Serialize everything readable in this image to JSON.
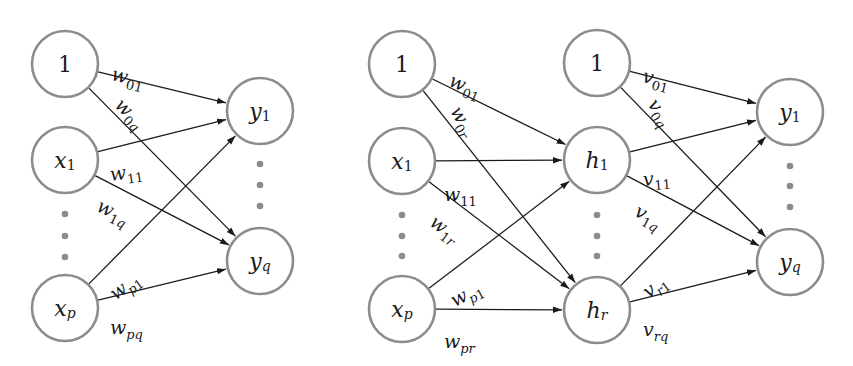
{
  "diagrams": [
    {
      "name": "single-layer-network",
      "node_radius": 33,
      "nodes": [
        {
          "id": "bias",
          "base": "1",
          "sub": "",
          "x": 65,
          "y": 64
        },
        {
          "id": "x1",
          "base": "x",
          "sub": "1",
          "x": 65,
          "y": 160
        },
        {
          "id": "xp",
          "base": "x",
          "sub": "p",
          "x": 65,
          "y": 308
        },
        {
          "id": "y1",
          "base": "y",
          "sub": "1",
          "x": 260,
          "y": 111
        },
        {
          "id": "yq",
          "base": "y",
          "sub": "q",
          "x": 260,
          "y": 261
        }
      ],
      "ellipses": [
        {
          "x": 65,
          "ys": [
            214,
            236,
            257
          ]
        },
        {
          "x": 260,
          "ys": [
            164,
            185,
            206
          ]
        }
      ],
      "edges": [
        {
          "from": "bias",
          "to": "y1",
          "label": "w",
          "sub": "01",
          "lx": 112,
          "ly": 64,
          "rot": 14
        },
        {
          "from": "bias",
          "to": "yq",
          "label": "w",
          "sub": "0q",
          "lx": 118,
          "ly": 92,
          "rot": 44
        },
        {
          "from": "x1",
          "to": "y1",
          "label": "w",
          "sub": "11",
          "lx": 110,
          "ly": 165,
          "rot": -8
        },
        {
          "from": "x1",
          "to": "yq",
          "label": "w",
          "sub": "1q",
          "lx": 98,
          "ly": 195,
          "rot": 25
        },
        {
          "from": "xp",
          "to": "y1",
          "label": "w",
          "sub": "p1",
          "lx": 112,
          "ly": 286,
          "rot": -36
        },
        {
          "from": "xp",
          "to": "yq",
          "label": "w",
          "sub": "pq",
          "lx": 110,
          "ly": 318,
          "rot": 0
        }
      ]
    },
    {
      "name": "two-layer-network",
      "node_radius": 33,
      "nodes": [
        {
          "id": "bias_in",
          "base": "1",
          "sub": "",
          "x": 402,
          "y": 64
        },
        {
          "id": "x1",
          "base": "x",
          "sub": "1",
          "x": 402,
          "y": 161
        },
        {
          "id": "xp",
          "base": "x",
          "sub": "p",
          "x": 402,
          "y": 309
        },
        {
          "id": "bias_h",
          "base": "1",
          "sub": "",
          "x": 597,
          "y": 63
        },
        {
          "id": "h1",
          "base": "h",
          "sub": "1",
          "x": 597,
          "y": 160
        },
        {
          "id": "hr",
          "base": "h",
          "sub": "r",
          "x": 597,
          "y": 310
        },
        {
          "id": "y1",
          "base": "y",
          "sub": "1",
          "x": 790,
          "y": 112
        },
        {
          "id": "yq",
          "base": "y",
          "sub": "q",
          "x": 790,
          "y": 262
        }
      ],
      "ellipses": [
        {
          "x": 402,
          "ys": [
            215,
            236,
            256
          ]
        },
        {
          "x": 597,
          "ys": [
            215,
            236,
            256
          ]
        },
        {
          "x": 790,
          "ys": [
            166,
            186,
            207
          ]
        }
      ],
      "edges": [
        {
          "from": "bias_in",
          "to": "h1",
          "label": "w",
          "sub": "01",
          "lx": 450,
          "ly": 70,
          "rot": 22
        },
        {
          "from": "bias_in",
          "to": "hr",
          "label": "w",
          "sub": "0r",
          "lx": 455,
          "ly": 98,
          "rot": 60
        },
        {
          "from": "x1",
          "to": "h1",
          "label": "w",
          "sub": "11",
          "lx": 444,
          "ly": 185,
          "rot": 0
        },
        {
          "from": "x1",
          "to": "hr",
          "label": "w",
          "sub": "1r",
          "lx": 432,
          "ly": 210,
          "rot": 36
        },
        {
          "from": "xp",
          "to": "h1",
          "label": "w",
          "sub": "p1",
          "lx": 452,
          "ly": 292,
          "rot": -28
        },
        {
          "from": "xp",
          "to": "hr",
          "label": "w",
          "sub": "pr",
          "lx": 444,
          "ly": 332,
          "rot": 0
        },
        {
          "from": "bias_h",
          "to": "y1",
          "label": "v",
          "sub": "01",
          "lx": 643,
          "ly": 66,
          "rot": 14
        },
        {
          "from": "bias_h",
          "to": "yq",
          "label": "v",
          "sub": "0q",
          "lx": 652,
          "ly": 91,
          "rot": 55
        },
        {
          "from": "h1",
          "to": "y1",
          "label": "v",
          "sub": "11",
          "lx": 643,
          "ly": 170,
          "rot": -5
        },
        {
          "from": "h1",
          "to": "yq",
          "label": "v",
          "sub": "1q",
          "lx": 636,
          "ly": 200,
          "rot": 28
        },
        {
          "from": "hr",
          "to": "y1",
          "label": "v",
          "sub": "r1",
          "lx": 645,
          "ly": 284,
          "rot": -36
        },
        {
          "from": "hr",
          "to": "yq",
          "label": "v",
          "sub": "rq",
          "lx": 643,
          "ly": 320,
          "rot": 0
        }
      ]
    }
  ],
  "colors": {
    "node_stroke": "#8c8c8c",
    "edge": "#1a1a1a",
    "text": "#1a1a1a",
    "dots": "#8c8c8c"
  }
}
